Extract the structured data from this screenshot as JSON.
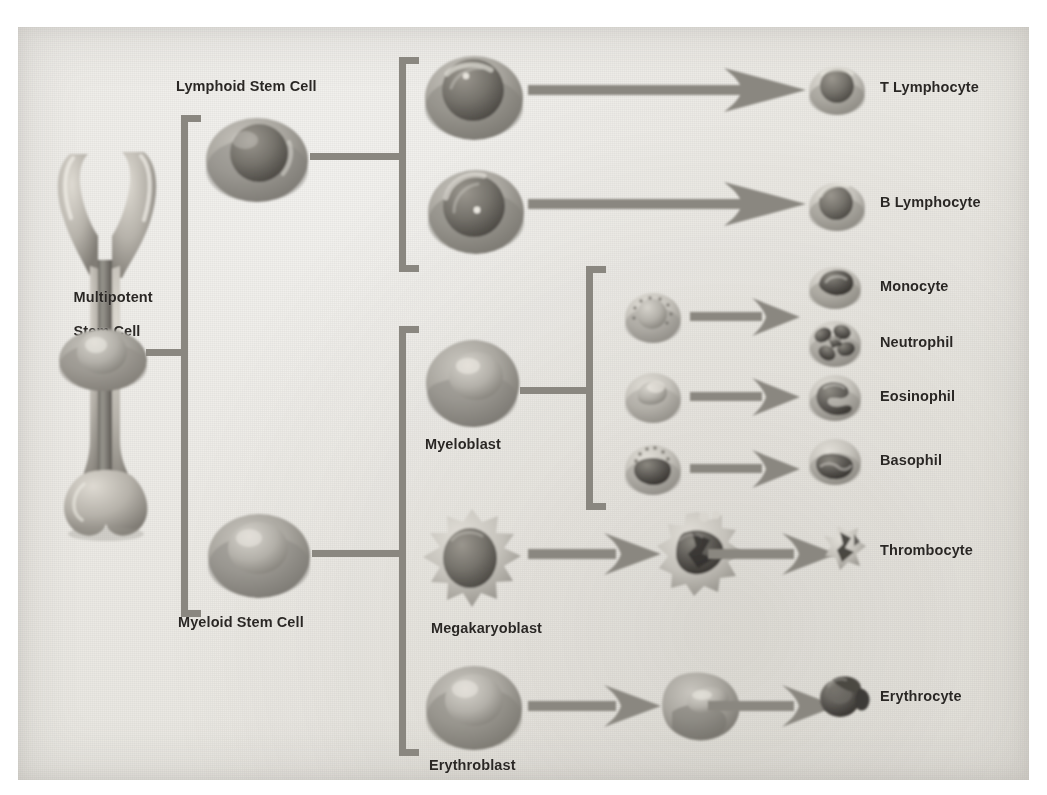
{
  "figure": {
    "background_color": "#ece9e3",
    "connector_color": "#8a8780",
    "label_color": "#2a2724"
  },
  "labels": {
    "multipotent_stem_cell_line1": "Multipotent",
    "multipotent_stem_cell_line2": "Stem Cell",
    "lymphoid_stem_cell": "Lymphoid Stem Cell",
    "myeloid_stem_cell": "Myeloid Stem Cell",
    "myeloblast": "Myeloblast",
    "megakaryoblast": "Megakaryoblast",
    "erythroblast": "Erythroblast",
    "t_lymphocyte": "T Lymphocyte",
    "b_lymphocyte": "B Lymphocyte",
    "monocyte": "Monocyte",
    "neutrophil": "Neutrophil",
    "eosinophil": "Eosinophil",
    "basophil": "Basophil",
    "thrombocyte": "Thrombocyte",
    "erythrocyte": "Erythrocyte"
  },
  "icons": {
    "bone": "long-bone-cutaway-icon",
    "stem_cell": "stem-cell-icon",
    "lymphoblast": "lymphoblast-cell-icon",
    "myeloblast": "myeloblast-cell-icon",
    "megakaryoblast": "megakaryoblast-cell-icon",
    "megakaryocyte": "megakaryocyte-cell-icon",
    "erythroblast": "erythroblast-cell-icon",
    "reticulocyte": "reticulocyte-cell-icon",
    "granulocyte_precursor": "granulocyte-precursor-icon",
    "arrow": "arrow-right-icon",
    "bracket": "bracket-icon"
  },
  "lineages": [
    {
      "name": "lymphoid",
      "parent": "Lymphoid Stem Cell",
      "products": [
        "T Lymphocyte",
        "B Lymphocyte"
      ]
    },
    {
      "name": "myeloid-granulocyte",
      "parent": "Myeloblast",
      "products": [
        "Monocyte",
        "Neutrophil",
        "Eosinophil",
        "Basophil"
      ]
    },
    {
      "name": "myeloid-platelet",
      "parent": "Megakaryoblast",
      "products": [
        "Thrombocyte"
      ]
    },
    {
      "name": "myeloid-erythroid",
      "parent": "Erythroblast",
      "products": [
        "Erythrocyte"
      ]
    }
  ]
}
